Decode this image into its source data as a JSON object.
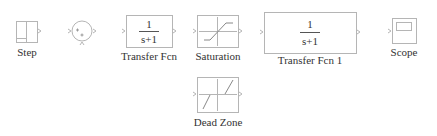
{
  "diagram": {
    "type": "simulink-block-library",
    "line_color": "#b0b0b0",
    "text_color": "#333333",
    "blocks": [
      {
        "id": "step",
        "label": "Step",
        "icon": "step-icon"
      },
      {
        "id": "sum",
        "label": "",
        "icon": "sum-icon",
        "signs": [
          "+",
          "+"
        ]
      },
      {
        "id": "transfer_fcn",
        "label": "Transfer Fcn",
        "numerator": "1",
        "denominator": "s+1"
      },
      {
        "id": "saturation",
        "label": "Saturation",
        "icon": "saturation-icon"
      },
      {
        "id": "transfer_fcn_1",
        "label": "Transfer Fcn 1",
        "numerator": "1",
        "denominator": "s+1"
      },
      {
        "id": "scope",
        "label": "Scope",
        "icon": "scope-icon"
      },
      {
        "id": "dead_zone",
        "label": "Dead Zone",
        "icon": "dead-zone-icon"
      }
    ]
  }
}
